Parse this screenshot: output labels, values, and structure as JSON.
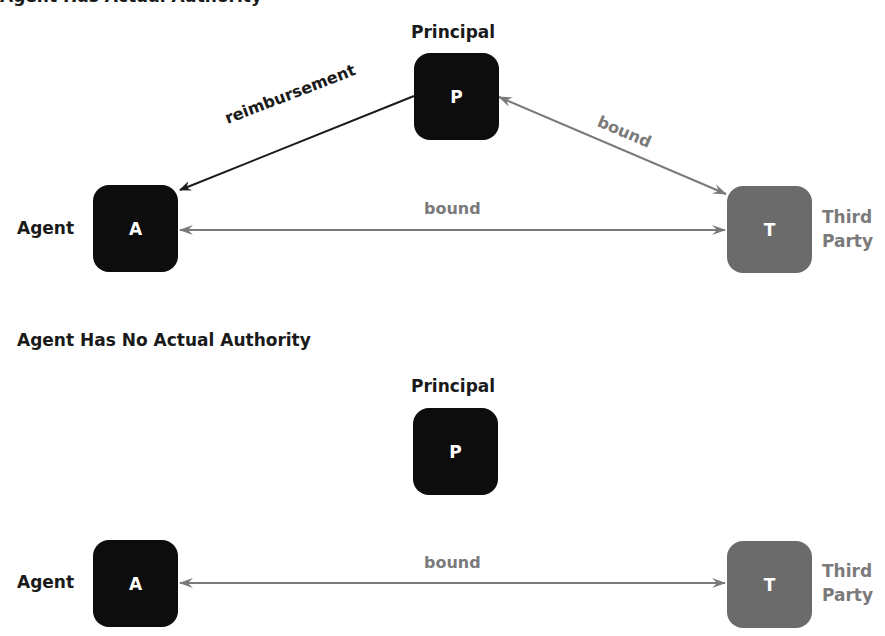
{
  "panels": [
    {
      "title": "Agent Has Actual Authority",
      "nodes": {
        "principal": {
          "label": "Principal",
          "letter": "P",
          "color": "#0d0d0d"
        },
        "agent": {
          "label": "Agent",
          "letter": "A",
          "color": "#0d0d0d"
        },
        "third_party": {
          "label_line1": "Third",
          "label_line2": "Party",
          "letter": "T",
          "color": "#6b6b6b"
        }
      },
      "edges": [
        {
          "from": "principal",
          "to": "agent",
          "label": "reimbursement",
          "direction": "one-way",
          "color": "#1a1a1a"
        },
        {
          "from": "principal",
          "to": "third_party",
          "label": "bound",
          "direction": "two-way",
          "color": "#7a7a7a"
        },
        {
          "from": "agent",
          "to": "third_party",
          "label": "bound",
          "direction": "two-way",
          "color": "#7a7a7a"
        }
      ]
    },
    {
      "title": "Agent Has No Actual Authority",
      "nodes": {
        "principal": {
          "label": "Principal",
          "letter": "P",
          "color": "#0d0d0d"
        },
        "agent": {
          "label": "Agent",
          "letter": "A",
          "color": "#0d0d0d"
        },
        "third_party": {
          "label_line1": "Third",
          "label_line2": "Party",
          "letter": "T",
          "color": "#6b6b6b"
        }
      },
      "edges": [
        {
          "from": "agent",
          "to": "third_party",
          "label": "bound",
          "direction": "two-way",
          "color": "#7a7a7a"
        }
      ]
    }
  ]
}
